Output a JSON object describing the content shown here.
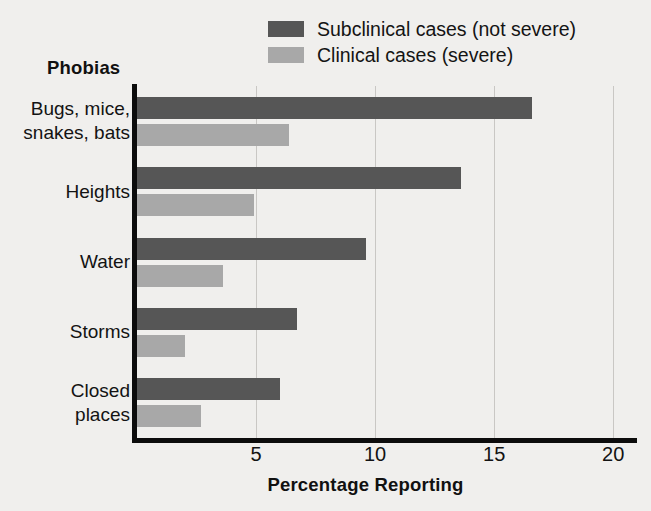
{
  "colors": {
    "background": "#f0efed",
    "subclinical": "#565656",
    "clinical": "#a8a8a8",
    "axis": "#0c0c0c",
    "gridline": "#c9c7c4",
    "text": "#131313"
  },
  "legend": {
    "items": [
      {
        "label": "Subclinical cases (not severe)",
        "color": "#565656",
        "series": "subclinical"
      },
      {
        "label": "Clinical cases (severe)",
        "color": "#a8a8a8",
        "series": "clinical"
      }
    ]
  },
  "axes": {
    "y_title": "Phobias",
    "x_title": "Percentage Reporting",
    "x_ticks": [
      "5",
      "10",
      "15",
      "20"
    ]
  },
  "chart_data": {
    "type": "bar",
    "orientation": "horizontal",
    "title": "",
    "subtitle": "",
    "xlabel": "Percentage Reporting",
    "ylabel": "Phobias",
    "xlim": [
      0,
      21
    ],
    "xticks": [
      5,
      10,
      15,
      20
    ],
    "grid": "vertical",
    "legend_position": "top-right",
    "categories": [
      "Bugs, mice,\nsnakes, bats",
      "Heights",
      "Water",
      "Storms",
      "Closed\nplaces"
    ],
    "category_lines": [
      [
        "Bugs, mice,",
        "snakes, bats"
      ],
      [
        "Heights"
      ],
      [
        "Water"
      ],
      [
        "Storms"
      ],
      [
        "Closed",
        "places"
      ]
    ],
    "series": [
      {
        "name": "Subclinical cases (not severe)",
        "color": "#565656",
        "values": [
          16.6,
          13.6,
          9.6,
          6.7,
          6.0
        ]
      },
      {
        "name": "Clinical cases (severe)",
        "color": "#a8a8a8",
        "values": [
          6.4,
          4.9,
          3.6,
          2.0,
          2.7
        ]
      }
    ]
  }
}
